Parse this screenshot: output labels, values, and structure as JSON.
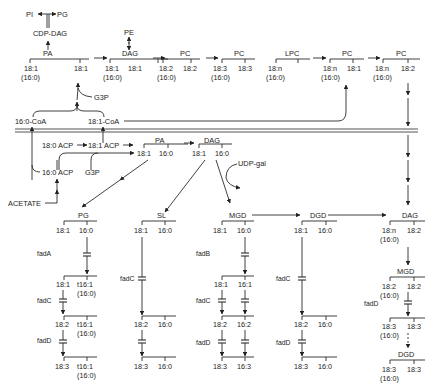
{
  "diagram": {
    "top_row": {
      "pi": "PI",
      "pg": "PG",
      "cdp_dag": "CDP-DAG",
      "pe": "PE",
      "g3p": "G3P",
      "compounds": [
        {
          "name": "PA",
          "sn1": "18:1",
          "sn1_alt": "(16:0)",
          "sn2": "18:1"
        },
        {
          "name": "DAG",
          "sn1": "18:1",
          "sn1_alt": "(16:0)",
          "sn2": "18:1"
        },
        {
          "name": "PC",
          "sn1": "18:2",
          "sn1_alt": "(16:0)",
          "sn2": "18:2"
        },
        {
          "name": "PC",
          "sn1": "18:3",
          "sn1_alt": "(16:0)",
          "sn2": "18:3"
        },
        {
          "name": "LPC",
          "sn1": "18:n",
          "sn1_alt": "(16:0)",
          "sn2": ""
        },
        {
          "name": "PC",
          "sn1": "18:n",
          "sn1_alt": "(16:0)",
          "sn2": "18:1"
        },
        {
          "name": "PC",
          "sn1": "18:n",
          "sn1_alt": "(16:0)",
          "sn2": "18:2"
        }
      ]
    },
    "acyl_coa": {
      "c16": "16:0-CoA",
      "c18": "18:1-CoA"
    },
    "plastid": {
      "acp_180": "18:0 ACP",
      "acp_181": "18:1 ACP",
      "acp_160": "16:0 ACP",
      "acetate": "ACETATE",
      "g3p": "G3P",
      "udp_gal": "UDP-gal",
      "pa": {
        "name": "PA",
        "sn1": "18:1",
        "sn2": "16:0"
      },
      "dag": {
        "name": "DAG",
        "sn1": "18:1",
        "sn2": "16:0"
      }
    },
    "columns": {
      "pg": {
        "name": "PG",
        "steps": [
          {
            "sn1": "18:1",
            "sn2": "16:0",
            "sn2_alt": ""
          },
          {
            "sn1": "18:1",
            "sn2": "t16:1",
            "sn2_alt": "(16:0)"
          },
          {
            "sn1": "18:2",
            "sn2": "t16:1",
            "sn2_alt": "(16:0)"
          },
          {
            "sn1": "18:3",
            "sn2": "t16:1",
            "sn2_alt": "(16:0)"
          }
        ],
        "enzymes": [
          "fadA",
          "fadC",
          "fadD"
        ]
      },
      "sl": {
        "name": "SL",
        "steps": [
          {
            "sn1": "18:1",
            "sn2": "16:0"
          },
          {
            "sn1": "18:2",
            "sn2": "16:0"
          },
          {
            "sn1": "18:3",
            "sn2": "16:0"
          }
        ],
        "enzymes": [
          "fadC"
        ]
      },
      "mgd": {
        "name": "MGD",
        "steps": [
          {
            "sn1": "18:1",
            "sn2": "16:0"
          },
          {
            "sn1": "18:1",
            "sn2": "16:1"
          },
          {
            "sn1": "18:2",
            "sn2": "16:2"
          },
          {
            "sn1": "18:3",
            "sn2": "16:3"
          }
        ],
        "enzymes": [
          "fadB",
          "fadC",
          "fadD"
        ]
      },
      "dgd": {
        "name": "DGD",
        "steps": [
          {
            "sn1": "18:1",
            "sn2": "16:0"
          },
          {
            "sn1": "18:2",
            "sn2": "16:0"
          },
          {
            "sn1": "18:3",
            "sn2": "16:0"
          }
        ],
        "enzymes": [
          "fadC",
          "fadD"
        ]
      },
      "euk": {
        "dag": {
          "name": "DAG",
          "sn1": "18:n",
          "sn1_alt": "(16:0)",
          "sn2": "18:2"
        },
        "mgd": {
          "name": "MGD",
          "sn1": "18:2",
          "sn1_alt": "(16:0)",
          "sn2": "18:2"
        },
        "mgd3": {
          "sn1": "18:3",
          "sn1_alt": "(16:0)",
          "sn2": "18:3"
        },
        "dgd": {
          "name": "DGD",
          "sn1": "18:3",
          "sn1_alt": "(16:0)",
          "sn2": "18:3"
        },
        "enzyme": "fadD"
      }
    }
  }
}
